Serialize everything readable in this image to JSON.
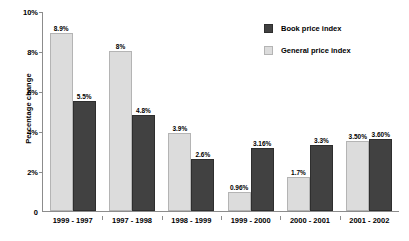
{
  "chart_data": {
    "type": "bar",
    "title": "",
    "xlabel": "",
    "ylabel": "Percentage change",
    "ylim": [
      0,
      10
    ],
    "yticks": [
      "0",
      "2%",
      "4%",
      "6%",
      "8%",
      "10%"
    ],
    "ytick_values": [
      0,
      2,
      4,
      6,
      8,
      10
    ],
    "grid": false,
    "legend_position": "top-right",
    "categories": [
      "1999 - 1997",
      "1997 - 1998",
      "1998 - 1999",
      "1999 - 2000",
      "2000 - 2001",
      "2001 - 2002"
    ],
    "series": [
      {
        "name": "General price index",
        "color": "#dcdcdc",
        "values": [
          8.9,
          8.0,
          3.9,
          0.96,
          1.7,
          3.5
        ],
        "labels": [
          "8.9%",
          "8%",
          "3.9%",
          "0.96%",
          "1.7%",
          "3.50%"
        ]
      },
      {
        "name": "Book price index",
        "color": "#414141",
        "values": [
          5.5,
          4.8,
          2.6,
          3.16,
          3.3,
          3.6
        ],
        "labels": [
          "5.5%",
          "4.8%",
          "2.6%",
          "3.16%",
          "3.3%",
          "3.60%"
        ]
      }
    ],
    "legend": [
      {
        "label": "Book price index",
        "color": "#414141"
      },
      {
        "label": "General price index",
        "color": "#dcdcdc"
      }
    ]
  }
}
